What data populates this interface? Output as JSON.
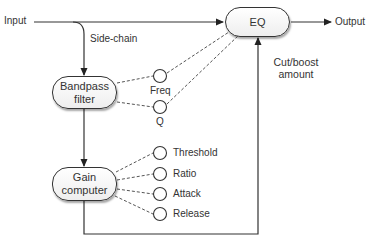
{
  "diagram": {
    "nodes": {
      "eq": {
        "label": "EQ"
      },
      "bandpass": {
        "label_line1": "Bandpass",
        "label_line2": "filter"
      },
      "gain": {
        "label_line1": "Gain",
        "label_line2": "computer"
      }
    },
    "labels": {
      "input": "Input",
      "output": "Output",
      "sidechain": "Side-chain",
      "cutboost_line1": "Cut/boost",
      "cutboost_line2": "amount"
    },
    "bandpass_params": [
      {
        "label": "Freq"
      },
      {
        "label": "Q"
      }
    ],
    "gain_params": [
      {
        "label": "Threshold"
      },
      {
        "label": "Ratio"
      },
      {
        "label": "Attack"
      },
      {
        "label": "Release"
      }
    ],
    "colors": {
      "stroke": "#333333",
      "background": "#ffffff"
    }
  }
}
